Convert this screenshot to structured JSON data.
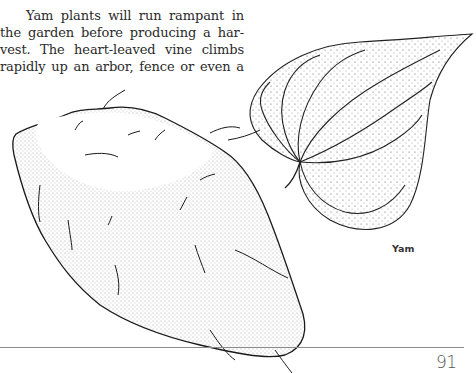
{
  "document": {
    "body_text_lines": [
      "Yam plants will run rampant in",
      "the garden before producing a har-",
      "vest. The heart-leaved vine climbs",
      "rapidly up an arbor, fence or even a"
    ],
    "figure": {
      "caption": "Yam",
      "icons": [
        "yam-tuber-illustration",
        "heart-shaped-leaf-illustration"
      ]
    },
    "footer": {
      "page_number": "91"
    }
  }
}
